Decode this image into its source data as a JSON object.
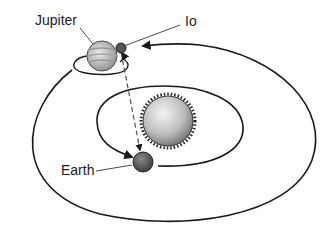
{
  "diagram": {
    "labels": {
      "jupiter": "Jupiter",
      "io": "Io",
      "earth": "Earth"
    },
    "colors": {
      "line": "#1a1a1a",
      "dashed": "#555555",
      "planet_light": "#e8e8e8",
      "planet_dark": "#7a7a7a"
    }
  }
}
